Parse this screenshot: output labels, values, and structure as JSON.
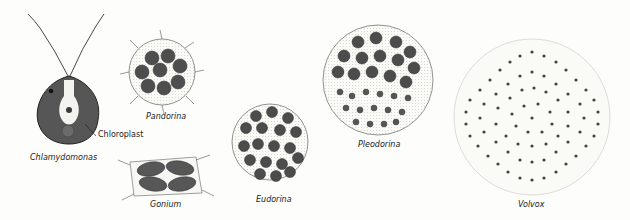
{
  "diagram": {
    "organisms": [
      {
        "name": "Chlamydomonas",
        "label": "Chlamydomonas",
        "form": "single cell"
      },
      {
        "name": "Pandorina",
        "label": "Pandorina",
        "form": "spherical colony"
      },
      {
        "name": "Gonium",
        "label": "Gonium",
        "form": "flat plate colony"
      },
      {
        "name": "Eudorina",
        "label": "Eudorina",
        "form": "spherical colony"
      },
      {
        "name": "Pleodorina",
        "label": "Pleodorina",
        "form": "spherical colony"
      },
      {
        "name": "Volvox",
        "label": "Volvox",
        "form": "hollow sphere colony"
      }
    ],
    "annotations": [
      {
        "label": "Chloroplast",
        "points_to": "Chlamydomonas chloroplast"
      }
    ],
    "colors": {
      "cell": "#4a4a4a",
      "outline": "#333333",
      "matrix": "#e6e6e0",
      "nucleus_region": "#f2f2ee"
    }
  }
}
